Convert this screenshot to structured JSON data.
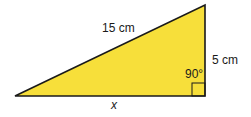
{
  "diagram": {
    "type": "right-triangle",
    "fill_color": "#F7DF3A",
    "stroke_color": "#1a1a1a",
    "labels": {
      "hypotenuse": "15 cm",
      "vertical_side": "5 cm",
      "base": "x",
      "right_angle": "90°"
    }
  }
}
